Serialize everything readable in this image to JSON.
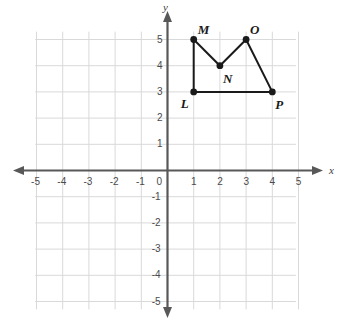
{
  "figure": {
    "background_color": "#ffffff",
    "grid_color": "#d9d9d9",
    "axis_color": "#585858",
    "shape_color": "#1a1a1a",
    "axis_names": {
      "x": "x",
      "y": "y"
    },
    "x_axis": {
      "min": -5,
      "max": 5,
      "tick_labels": [
        "-5",
        "-4",
        "-3",
        "-2",
        "-1",
        "0",
        "1",
        "2",
        "3",
        "4",
        "5"
      ],
      "tick_values": [
        -5,
        -4,
        -3,
        -2,
        -1,
        0,
        1,
        2,
        3,
        4,
        5
      ]
    },
    "y_axis": {
      "min": -5,
      "max": 5,
      "tick_labels": [
        "5",
        "4",
        "3",
        "2",
        "1",
        "-1",
        "-2",
        "-3",
        "-4",
        "-5"
      ],
      "tick_values": [
        5,
        4,
        3,
        2,
        1,
        -1,
        -2,
        -3,
        -4,
        -5
      ]
    },
    "origin_label": "0"
  },
  "chart_data": {
    "type": "scatter",
    "title": "",
    "xlabel": "x",
    "ylabel": "y",
    "xlim": [
      -5,
      5
    ],
    "ylim": [
      -5,
      5
    ],
    "grid": true,
    "legend": "none",
    "shape": {
      "name": "LMNOP",
      "closed": true,
      "vertices": [
        {
          "label": "L",
          "x": 1,
          "y": 3,
          "label_pos": "below-left"
        },
        {
          "label": "M",
          "x": 1,
          "y": 5,
          "label_pos": "above-right"
        },
        {
          "label": "N",
          "x": 2,
          "y": 4,
          "label_pos": "below-right"
        },
        {
          "label": "O",
          "x": 3,
          "y": 5,
          "label_pos": "above-right"
        },
        {
          "label": "P",
          "x": 4,
          "y": 3,
          "label_pos": "below-right"
        }
      ],
      "edges": [
        [
          "L",
          "M"
        ],
        [
          "M",
          "N"
        ],
        [
          "N",
          "O"
        ],
        [
          "O",
          "P"
        ],
        [
          "P",
          "L"
        ]
      ]
    }
  }
}
